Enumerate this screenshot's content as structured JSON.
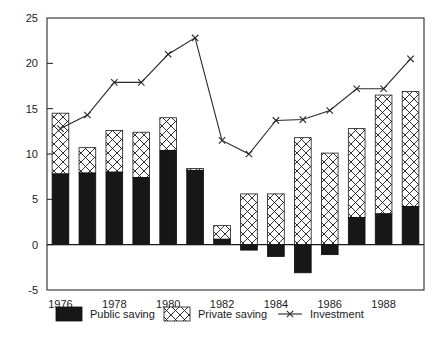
{
  "chart_data": {
    "type": "bar",
    "title": "",
    "subtitle": "",
    "xlabel": "",
    "ylabel": "",
    "ylim": [
      -5,
      25
    ],
    "yticks": [
      -5,
      0,
      5,
      10,
      15,
      20,
      25
    ],
    "ytick_labels": [
      "-5",
      "0",
      "5",
      "10",
      "15",
      "20",
      "25"
    ],
    "grid": false,
    "stacked": true,
    "legend_position": "below-axes",
    "categories": [
      1976,
      1977,
      1978,
      1979,
      1980,
      1981,
      1982,
      1983,
      1984,
      1985,
      1986,
      1987,
      1988,
      1989
    ],
    "xtick_labels": [
      "1976",
      "",
      "1978",
      "",
      "1980",
      "",
      "1982",
      "",
      "1984",
      "",
      "1986",
      "",
      "1988",
      ""
    ],
    "series": [
      {
        "name": "Public saving",
        "type": "bar",
        "fill": "solid-black",
        "color": "#171717",
        "values": [
          7.8,
          7.9,
          8.0,
          7.4,
          10.4,
          8.2,
          0.6,
          -0.6,
          -1.3,
          -3.1,
          -1.1,
          3.0,
          3.4,
          4.2
        ]
      },
      {
        "name": "Private saving",
        "type": "bar",
        "fill": "cross-hatch",
        "color": "#ffffff",
        "values": [
          6.7,
          2.8,
          4.6,
          5.0,
          3.6,
          0.2,
          1.5,
          5.6,
          5.6,
          11.8,
          10.1,
          9.8,
          13.1,
          12.7
        ]
      },
      {
        "name": "Investment",
        "type": "line",
        "marker": "x",
        "color": "#2a2a2a",
        "values": [
          12.8,
          14.3,
          17.9,
          17.9,
          21.0,
          22.8,
          11.5,
          10.0,
          13.7,
          13.8,
          14.8,
          17.2,
          17.2,
          20.5
        ]
      }
    ],
    "stack_totals": [
      14.5,
      10.7,
      12.6,
      12.4,
      14.0,
      8.4,
      2.1,
      5.0,
      4.3,
      8.7,
      9.0,
      12.8,
      16.5,
      16.9
    ]
  },
  "legend": {
    "items": [
      {
        "label": "Public saving",
        "swatch": "solid-black-square"
      },
      {
        "label": "Private saving",
        "swatch": "cross-hatch-square"
      },
      {
        "label": "Investment",
        "swatch": "line-with-x-marker"
      }
    ]
  }
}
